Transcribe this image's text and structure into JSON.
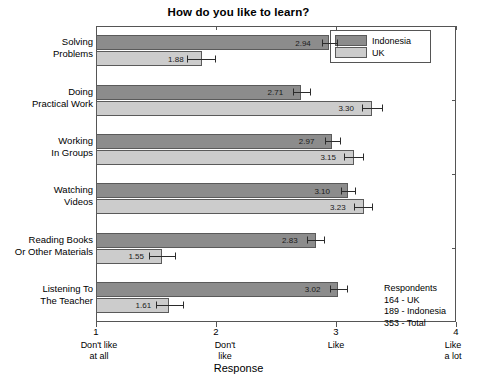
{
  "chart_data": {
    "type": "bar",
    "orientation": "horizontal",
    "title": "How do you like to learn?",
    "xlabel": "Response",
    "ylabel": "",
    "xlim": [
      1,
      4
    ],
    "grid": false,
    "legend_position": "top-right",
    "xticks": [
      {
        "value": 1,
        "label": "1",
        "caption_line1": "Don't like",
        "caption_line2": "at all"
      },
      {
        "value": 2,
        "label": "2",
        "caption_line1": "Don't",
        "caption_line2": "like"
      },
      {
        "value": 3,
        "label": "3",
        "caption_line1": "Like",
        "caption_line2": ""
      },
      {
        "value": 4,
        "label": "4",
        "caption_line1": "Like",
        "caption_line2": "a lot"
      }
    ],
    "categories": [
      {
        "line1": "Solving",
        "line2": "Problems"
      },
      {
        "line1": "Doing",
        "line2": "Practical Work"
      },
      {
        "line1": "Working",
        "line2": "In Groups"
      },
      {
        "line1": "Watching",
        "line2": "Videos"
      },
      {
        "line1": "Reading Books",
        "line2": "Or Other Materials"
      },
      {
        "line1": "Listening To",
        "line2": "The Teacher"
      }
    ],
    "series": [
      {
        "name": "Indonesia",
        "color": "#8c8c8c",
        "values": [
          2.94,
          2.71,
          2.97,
          3.1,
          2.83,
          3.02
        ],
        "value_labels": [
          "2.94",
          "2.71",
          "2.97",
          "3.10",
          "2.83",
          "3.02"
        ],
        "error_low": [
          2.88,
          2.64,
          2.91,
          3.04,
          2.76,
          2.95
        ],
        "error_high": [
          3.02,
          2.79,
          3.04,
          3.17,
          2.91,
          3.1
        ]
      },
      {
        "name": "UK",
        "color": "#cccccc",
        "values": [
          1.88,
          3.3,
          3.15,
          3.23,
          1.55,
          1.61
        ],
        "value_labels": [
          "1.88",
          "3.30",
          "3.15",
          "3.23",
          "1.55",
          "1.61"
        ],
        "error_low": [
          1.76,
          3.22,
          3.07,
          3.15,
          1.44,
          1.5
        ],
        "error_high": [
          2.0,
          3.39,
          3.23,
          3.31,
          1.67,
          1.73
        ]
      }
    ]
  },
  "legend": {
    "items": [
      {
        "label": "Indonesia",
        "color": "#8c8c8c"
      },
      {
        "label": "UK",
        "color": "#cccccc"
      }
    ]
  },
  "respondents": {
    "heading": "Respondents",
    "lines": [
      "164 - UK",
      "189 - Indonesia",
      "353 - Total"
    ]
  }
}
